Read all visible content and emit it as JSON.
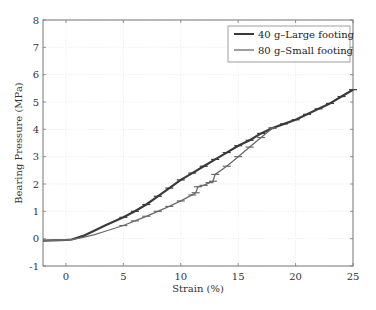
{
  "chart_data": {
    "type": "line",
    "title": "",
    "xlabel": "Strain (%)",
    "ylabel": "Bearing Pressure (MPa)",
    "xlim": [
      -2,
      25
    ],
    "ylim": [
      -1,
      8
    ],
    "xticks": [
      0,
      5,
      10,
      15,
      20,
      25
    ],
    "yticks": [
      -1,
      0,
      1,
      2,
      3,
      4,
      5,
      6,
      7,
      8
    ],
    "grid": true,
    "legend_position": "upper right",
    "series": [
      {
        "name": "40 g–Large footing",
        "color": "#3a3a3a",
        "width": 2.2,
        "markers": "error-bar ticks",
        "x": [
          -2,
          0,
          0.5,
          1.5,
          2.5,
          3.5,
          5,
          6,
          7,
          8,
          9,
          10,
          11,
          12,
          13,
          14,
          15,
          16,
          17,
          18,
          19,
          20,
          21,
          22,
          23,
          24,
          25
        ],
        "y": [
          -0.07,
          -0.05,
          -0.03,
          0.1,
          0.3,
          0.5,
          0.78,
          1.0,
          1.25,
          1.55,
          1.85,
          2.15,
          2.4,
          2.65,
          2.9,
          3.15,
          3.4,
          3.6,
          3.85,
          4.05,
          4.2,
          4.35,
          4.55,
          4.75,
          4.95,
          5.2,
          5.45
        ]
      },
      {
        "name": "80 g–Small footing",
        "color": "#6a6a6a",
        "width": 1.3,
        "markers": "error-bar ticks",
        "x": [
          -2,
          0,
          0.5,
          1.5,
          2.5,
          3.5,
          5,
          6,
          7,
          8,
          9,
          10,
          11,
          11.3,
          11.5,
          12,
          12.5,
          12.8,
          13,
          14,
          15,
          16,
          17,
          18
        ],
        "y": [
          -0.07,
          -0.05,
          -0.03,
          0.05,
          0.15,
          0.28,
          0.48,
          0.65,
          0.82,
          1.0,
          1.18,
          1.38,
          1.6,
          1.68,
          1.9,
          1.95,
          2.05,
          2.1,
          2.35,
          2.65,
          3.0,
          3.35,
          3.7,
          4.05
        ]
      }
    ]
  }
}
